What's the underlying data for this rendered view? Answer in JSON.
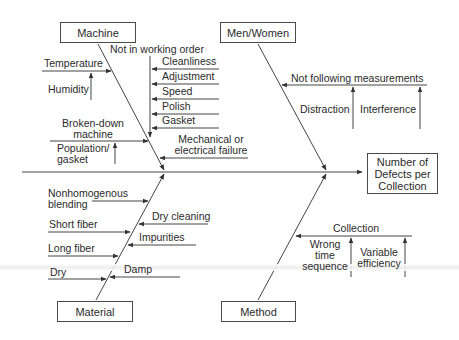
{
  "diagram": {
    "type": "fishbone",
    "effect": "Number of Defects per Collection",
    "effect_lines": [
      "Number of",
      "Defects per",
      "Collection"
    ],
    "categories": {
      "machine": {
        "label": "Machine",
        "causes": {
          "temperature": "Temperature",
          "humidity": "Humidity",
          "not_in_working_order": "Not in working order",
          "cleanliness": "Cleanliness",
          "adjustment": "Adjustment",
          "speed": "Speed",
          "polish": "Polish",
          "gasket": "Gasket",
          "broken_down_1": "Broken-down",
          "broken_down_2": "machine",
          "population_1": "Population/",
          "population_2": "gasket",
          "mech_1": "Mechanical or",
          "mech_2": "electrical failure"
        }
      },
      "men_women": {
        "label": "Men/Women",
        "causes": {
          "not_following": "Not following measurements",
          "distraction": "Distraction",
          "interference": "Interference"
        }
      },
      "material": {
        "label": "Material",
        "causes": {
          "nonhomog_1": "Nonhomogenous",
          "nonhomog_2": "blending",
          "dry_cleaning": "Dry cleaning",
          "short_fiber": "Short fiber",
          "impurities": "Impurities",
          "long_fiber": "Long fiber",
          "dry": "Dry",
          "damp": "Damp"
        }
      },
      "method": {
        "label": "Method",
        "causes": {
          "collection": "Collection",
          "wrong_1": "Wrong",
          "wrong_2": "time",
          "wrong_3": "sequence",
          "variable_1": "Variable",
          "variable_2": "efficiency"
        }
      }
    }
  }
}
